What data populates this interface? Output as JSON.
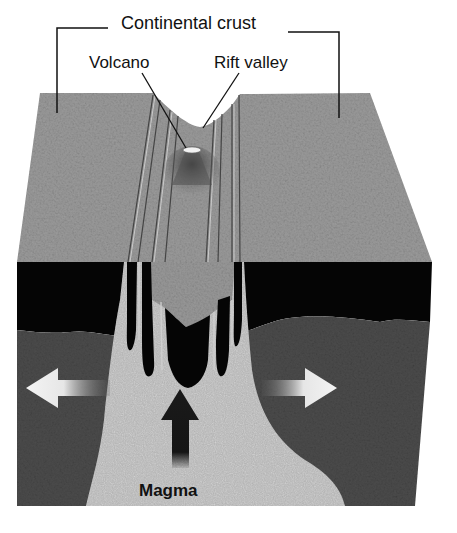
{
  "diagram": {
    "labels": {
      "continental_crust": "Continental crust",
      "volcano": "Volcano",
      "rift_valley": "Rift valley",
      "magma": "Magma"
    },
    "arrows": {
      "left": "spreading-left",
      "right": "spreading-right",
      "up": "magma-rising"
    },
    "colors": {
      "crust_surface": "#9a9a9a",
      "lithosphere_band": "#050505",
      "mantle": "#4a4a4a",
      "magma_plume": "#a8a8a8",
      "arrow_light": "#f2f2f2",
      "arrow_dark": "#1a1a1a",
      "text": "#111111"
    }
  }
}
